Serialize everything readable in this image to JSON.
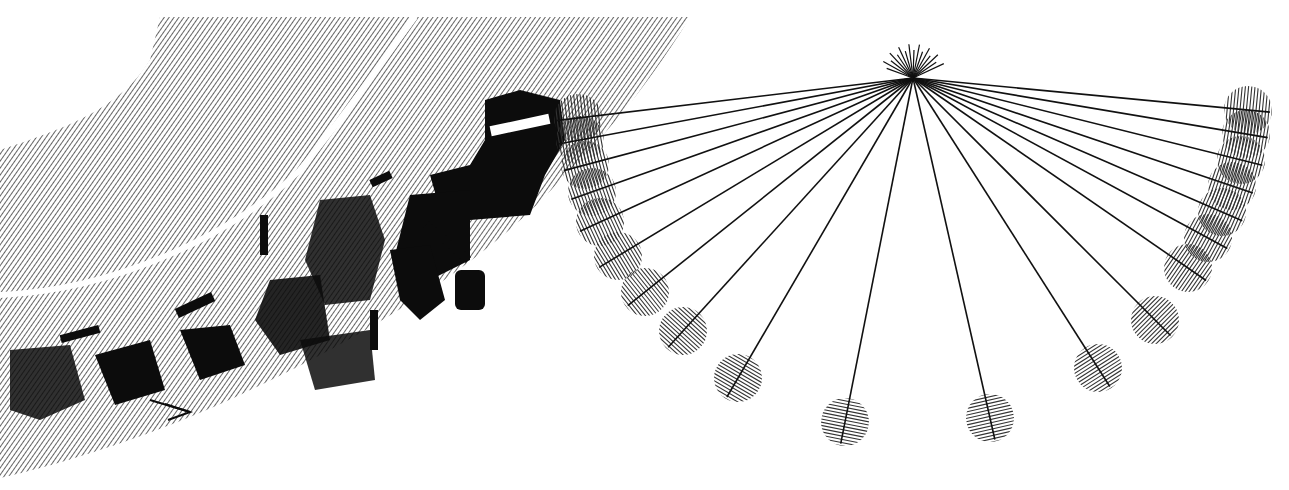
{
  "illustration": {
    "style": "monochrome hatched line art",
    "colors": {
      "ink": "#111111",
      "background": "#ffffff"
    },
    "center": {
      "x": 913,
      "y": 78
    },
    "circle_radius": 24,
    "circles": [
      {
        "x": 1248,
        "y": 110
      },
      {
        "x": 1246,
        "y": 134
      },
      {
        "x": 1241,
        "y": 160
      },
      {
        "x": 1232,
        "y": 186
      },
      {
        "x": 1222,
        "y": 212
      },
      {
        "x": 1208,
        "y": 238
      },
      {
        "x": 1188,
        "y": 268
      },
      {
        "x": 1155,
        "y": 320
      },
      {
        "x": 1098,
        "y": 368
      },
      {
        "x": 990,
        "y": 418
      },
      {
        "x": 845,
        "y": 422
      },
      {
        "x": 738,
        "y": 378
      },
      {
        "x": 683,
        "y": 331
      },
      {
        "x": 645,
        "y": 292
      },
      {
        "x": 618,
        "y": 256
      },
      {
        "x": 600,
        "y": 222
      },
      {
        "x": 592,
        "y": 192
      },
      {
        "x": 585,
        "y": 165
      },
      {
        "x": 580,
        "y": 140
      },
      {
        "x": 578,
        "y": 118
      }
    ]
  }
}
